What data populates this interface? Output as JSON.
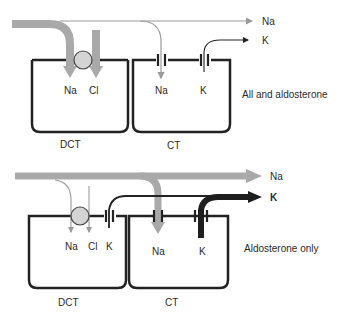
{
  "colors": {
    "thick_gray": "#a9a9a9",
    "thin_gray": "#9a9a9a",
    "cell_wall": "#222222",
    "transporter_fill": "#d4d4d4",
    "thick_black": "#1e1e1e",
    "text": "#2a2a2a"
  },
  "panels": [
    {
      "condition": "All and aldosterone",
      "cells": [
        {
          "name": "DCT",
          "ions": [
            "Na",
            "Cl"
          ]
        },
        {
          "name": "CT",
          "ions": [
            "Na",
            "K"
          ]
        }
      ],
      "outflow_labels": {
        "na": "Na",
        "k": "K"
      }
    },
    {
      "condition": "Aldosterone only",
      "cells": [
        {
          "name": "DCT",
          "ions": [
            "Na",
            "Cl",
            "K"
          ]
        },
        {
          "name": "CT",
          "ions": [
            "Na",
            "K"
          ]
        }
      ],
      "outflow_labels": {
        "na": "Na",
        "k": "K"
      }
    }
  ]
}
